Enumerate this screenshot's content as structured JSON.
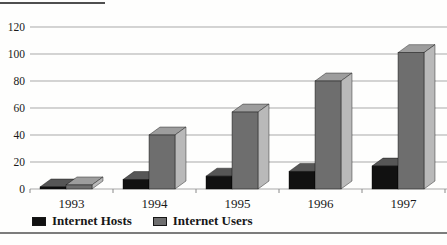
{
  "chart_data": {
    "type": "bar",
    "style": "3d-columns",
    "title": "",
    "xlabel": "",
    "ylabel": "",
    "categories": [
      "1993",
      "1994",
      "1995",
      "1996",
      "1997"
    ],
    "series": [
      {
        "name": "Internet Hosts",
        "values": [
          1.5,
          7,
          9.5,
          13,
          17
        ],
        "color_front": "#111111",
        "color_top": "#565656",
        "color_side": "#8d8d8d"
      },
      {
        "name": "Internet Users",
        "values": [
          3,
          40,
          57,
          80,
          101
        ],
        "color_front": "#6e6e6e",
        "color_top": "#9d9d9d",
        "color_side": "#b9b9b9"
      }
    ],
    "ylim": [
      0,
      120
    ],
    "ytick_interval": 20,
    "ytick_labels": [
      "0",
      "20",
      "40",
      "60",
      "80",
      "100",
      "120"
    ],
    "grid": true,
    "gridline_color": "#a9a9a9",
    "tick_color": "#8a8a8a",
    "axis_text_color": "#1a1a1a",
    "legend_position": "bottom-left"
  },
  "decorations": {
    "top_partial_rule_color": "#4f4f4f",
    "bottom_rule_color": "#7c7c7c",
    "background": "#fefefd"
  }
}
